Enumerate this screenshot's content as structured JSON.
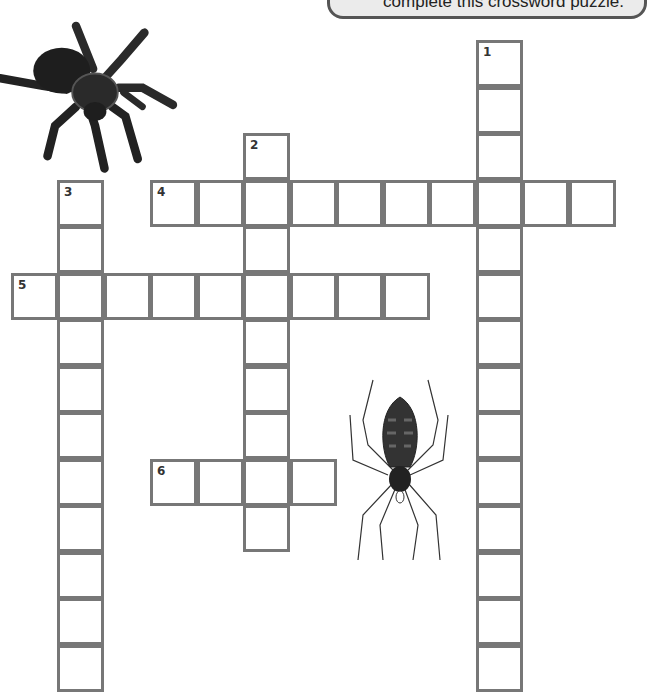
{
  "instruction_bubble": {
    "text": "complete this crossword puzzle."
  },
  "puzzle": {
    "origin": {
      "x": 150,
      "y": 40
    },
    "cell_size": 46.5,
    "entries": [
      {
        "number": "1",
        "direction": "down",
        "col": 7,
        "row": 0,
        "length": 14
      },
      {
        "number": "2",
        "direction": "down",
        "col": 2,
        "row": 2,
        "length": 9
      },
      {
        "number": "3",
        "direction": "down",
        "col": -2,
        "row": 3,
        "length": 11
      },
      {
        "number": "4",
        "direction": "across",
        "col": 0,
        "row": 3,
        "length": 10
      },
      {
        "number": "5",
        "direction": "across",
        "col": -3,
        "row": 5,
        "length": 9
      },
      {
        "number": "6",
        "direction": "across",
        "col": 0,
        "row": 9,
        "length": 4
      }
    ],
    "colors": {
      "border": "#777777",
      "number": "#333333"
    }
  },
  "illustrations": [
    {
      "name": "tarantula",
      "position": "top-left"
    },
    {
      "name": "orb-weaver-spider",
      "position": "center-right"
    }
  ]
}
